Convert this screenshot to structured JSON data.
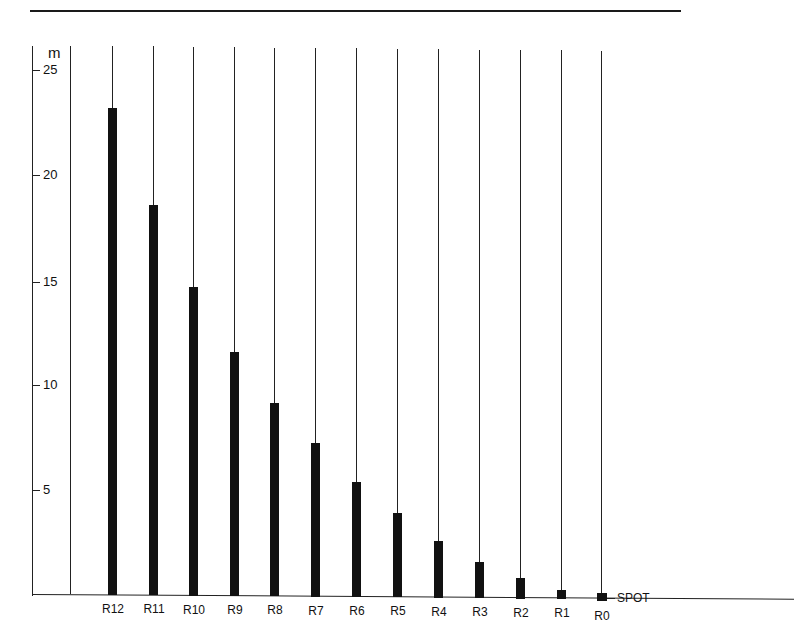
{
  "chart_data": {
    "type": "bar",
    "title": "",
    "xlabel": "",
    "ylabel": "m",
    "ylim": [
      0,
      25
    ],
    "yticks": [
      5,
      10,
      15,
      20,
      25
    ],
    "grid": false,
    "categories": [
      "R12",
      "R11",
      "R10",
      "R9",
      "R8",
      "R7",
      "R6",
      "R5",
      "R4",
      "R3",
      "R2",
      "R1",
      "R0"
    ],
    "values": [
      23.2,
      18.6,
      14.7,
      11.6,
      9.2,
      7.3,
      5.5,
      4.0,
      2.7,
      1.7,
      1.0,
      0.4,
      0.1
    ],
    "annotations": [
      {
        "text": "SPOT",
        "at": "R0"
      }
    ]
  },
  "axis": {
    "unit": "m",
    "ticks": [
      {
        "label": "25",
        "y": 70
      },
      {
        "label": "20",
        "y": 175
      },
      {
        "label": "15",
        "y": 282
      },
      {
        "label": "10",
        "y": 385
      },
      {
        "label": "5",
        "y": 490
      }
    ]
  },
  "bars": [
    {
      "label": "R12",
      "x": 108,
      "value": 23.2
    },
    {
      "label": "R11",
      "x": 149,
      "value": 18.6
    },
    {
      "label": "R10",
      "x": 189,
      "value": 14.7
    },
    {
      "label": "R9",
      "x": 230,
      "value": 11.6
    },
    {
      "label": "R8",
      "x": 270,
      "value": 9.2
    },
    {
      "label": "R7",
      "x": 311,
      "value": 7.3
    },
    {
      "label": "R6",
      "x": 352,
      "value": 5.5
    },
    {
      "label": "R5",
      "x": 393,
      "value": 4.0
    },
    {
      "label": "R4",
      "x": 434,
      "value": 2.7
    },
    {
      "label": "R3",
      "x": 475,
      "value": 1.7
    },
    {
      "label": "R2",
      "x": 516,
      "value": 1.0
    },
    {
      "label": "R1",
      "x": 557,
      "value": 0.4
    },
    {
      "label": "R0",
      "x": 597,
      "value": 0.1
    }
  ],
  "spot_label": "SPOT"
}
